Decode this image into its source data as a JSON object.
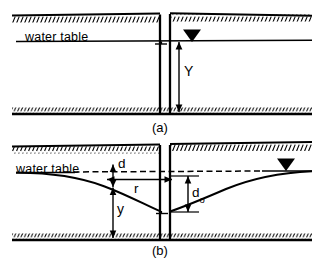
{
  "figure": {
    "type": "engineering-diagram",
    "background_color": "#ffffff",
    "ink_color": "#000000",
    "width": 324,
    "height": 263
  },
  "panel_a": {
    "caption": "(a)",
    "water_table_label": "water table",
    "dimension_label": "Y",
    "water_surface_marker": "water-table-triangle-icon",
    "ground_surface_icon": "ground-hatch-icon",
    "bedrock_icon": "ground-hatch-icon",
    "well_icon": "well-casing-icon"
  },
  "panel_b": {
    "caption": "(b)",
    "water_table_label": "water table",
    "labels": {
      "drawdown_at_r": "d",
      "radius": "r",
      "head_at_r": "y",
      "drawdown_at_well_base": "d",
      "drawdown_at_well_sub": "o"
    },
    "water_surface_marker": "water-table-triangle-icon",
    "ground_surface_icon": "ground-hatch-icon",
    "bedrock_icon": "ground-hatch-icon",
    "well_icon": "well-casing-icon",
    "static_level_icon": "dashed-static-water-level-icon",
    "drawdown_curve_icon": "cone-of-depression-curve-icon"
  }
}
